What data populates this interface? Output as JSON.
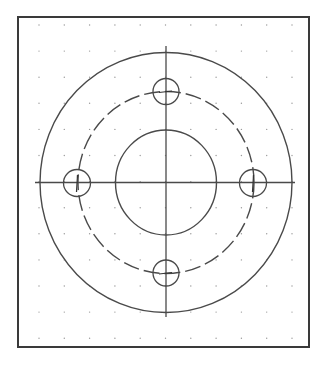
{
  "drawing": {
    "type": "flange-top-view",
    "frame": {
      "x": 18,
      "y": 17,
      "width": 291,
      "height": 330
    },
    "grid": {
      "dot_origin_x": 39,
      "dot_origin_y": 25,
      "dot_spacing_x": 25.3,
      "dot_spacing_y": 26.1,
      "columns": 11,
      "rows": 13
    },
    "center": {
      "x": 166,
      "y": 182.5
    },
    "center_lines": {
      "horizontal": {
        "x1": 35,
        "x2": 295
      },
      "vertical": {
        "y1": 46,
        "y2": 317
      }
    },
    "outer_circle": {
      "rx": 126,
      "ry": 130
    },
    "inner_bore": {
      "rx": 50.5,
      "ry": 52.5
    },
    "bolt_circle": {
      "rx": 88,
      "ry": 91,
      "style": "dashed"
    },
    "bolt_holes": [
      {
        "name": "top",
        "cx": 166,
        "cy": 91.5,
        "r": 13
      },
      {
        "name": "left",
        "cx": 77,
        "cy": 183,
        "r": 13.5
      },
      {
        "name": "right",
        "cx": 253,
        "cy": 183,
        "r": 13.5
      },
      {
        "name": "bottom",
        "cx": 166,
        "cy": 273,
        "r": 13
      }
    ],
    "colors": {
      "line": "#4a4a4a",
      "frame": "#3a3a3a",
      "grid_dot": "#9a9a9a",
      "background": "#ffffff"
    }
  }
}
